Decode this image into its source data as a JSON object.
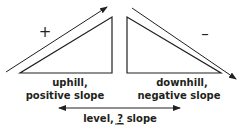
{
  "diagram": {
    "colors": {
      "stroke": "#231f20",
      "background": "#ffffff"
    },
    "uphill": {
      "sign": "+",
      "label_line1": "uphill,",
      "label_line2": "positive slope"
    },
    "downhill": {
      "sign": "–",
      "label_line1": "downhill,",
      "label_line2": "negative slope"
    },
    "level": {
      "label_prefix": "level, ",
      "label_blank": "?",
      "label_suffix": " slope"
    }
  }
}
